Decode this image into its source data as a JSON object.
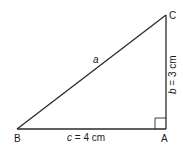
{
  "diagram": {
    "type": "right-triangle",
    "stroke_color": "#2a2a2a",
    "vertices": {
      "A": {
        "label": "A"
      },
      "B": {
        "label": "B"
      },
      "C": {
        "label": "C"
      }
    },
    "sides": {
      "a": {
        "var": "a",
        "text": ""
      },
      "b": {
        "var": "b",
        "text": " = 3 cm"
      },
      "c": {
        "var": "c",
        "text": " = 4 cm"
      }
    },
    "right_angle_at": "A"
  }
}
